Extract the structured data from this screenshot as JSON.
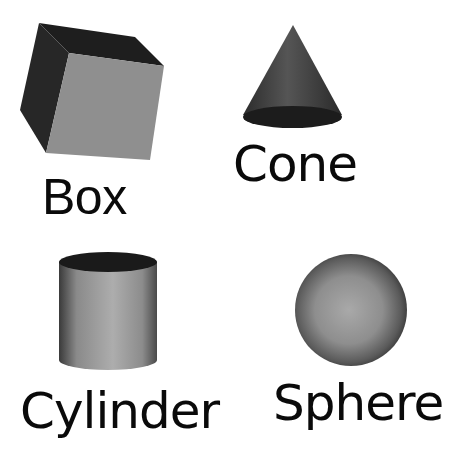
{
  "figure": {
    "shapes": [
      {
        "id": "box",
        "label": "Box",
        "face_color": "#8f8f8f",
        "side_color": "#262626",
        "top_color": "#1e1e1e"
      },
      {
        "id": "cone",
        "label": "Cone",
        "body_color": "#4a4a4a",
        "base_color": "#1c1c1c"
      },
      {
        "id": "cylinder",
        "label": "Cylinder",
        "body_light": "#a8a8a8",
        "body_dark": "#3a3a3a",
        "top_color": "#1a1a1a"
      },
      {
        "id": "sphere",
        "label": "Sphere",
        "center_color": "#a6a6a6",
        "edge_color": "#3a3a3a"
      }
    ]
  }
}
